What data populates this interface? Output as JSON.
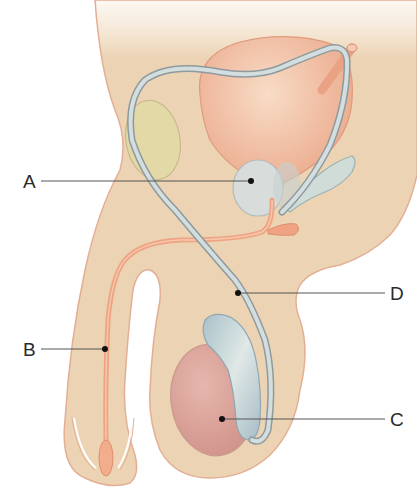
{
  "diagram": {
    "colors": {
      "skin": "#ecd3b3",
      "skin_outline": "#e2a88a",
      "bladder": "#eaa987",
      "duct": "#c9d4d4",
      "duct_outline": "#8e9a9e",
      "prostate": "#d6dcdb",
      "seminal_vesicle": "#cfdcd8",
      "pubic_bone": "#dcd6a0",
      "urethra": "#efa382",
      "testis": "#d9a49a",
      "epididymis": "#b9cdd3",
      "leader_line": "#555555",
      "label_text": "#2a2a2a"
    },
    "labels": [
      {
        "id": "A",
        "text": "A",
        "points_to": "prostate gland"
      },
      {
        "id": "B",
        "text": "B",
        "points_to": "urethra"
      },
      {
        "id": "C",
        "text": "C",
        "points_to": "testis"
      },
      {
        "id": "D",
        "text": "D",
        "points_to": "vas deferens"
      }
    ]
  }
}
